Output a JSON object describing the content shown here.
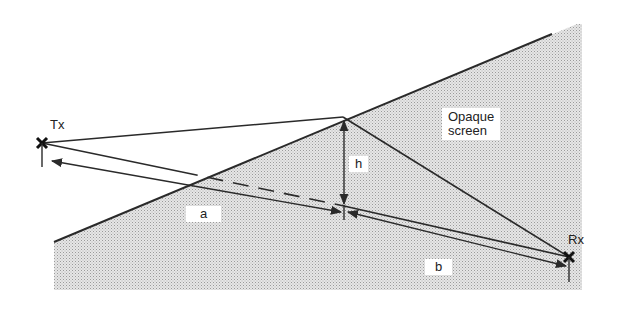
{
  "diagram": {
    "type": "knife-edge diffraction geometry",
    "labels": {
      "transmitter": "Tx",
      "receiver": "Rx",
      "height": "h",
      "distance_a": "a",
      "distance_b": "b",
      "screen_line1": "Opaque",
      "screen_line2": "screen"
    },
    "colors": {
      "line": "#2a2a2a",
      "shading": "#d4d4d4",
      "background": "#ffffff"
    },
    "points": {
      "tx": [
        42,
        143
      ],
      "rx": [
        569,
        257
      ],
      "edge_peak": [
        343,
        117
      ],
      "screen_edge_start": [
        54,
        242
      ],
      "screen_edge_end": [
        577,
        24
      ]
    }
  }
}
